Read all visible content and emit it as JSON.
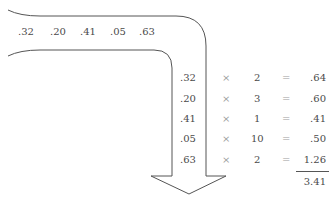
{
  "sequence": [
    ".32",
    ".20",
    ".41",
    ".05",
    ".63"
  ],
  "rows": [
    {
      "value": ".32",
      "times": "×",
      "weight": "2",
      "equals": "=",
      "product": ".64"
    },
    {
      "value": ".20",
      "times": "×",
      "weight": "3",
      "equals": "=",
      "product": ".60"
    },
    {
      "value": ".41",
      "times": "×",
      "weight": "1",
      "equals": "=",
      "product": ".41"
    },
    {
      "value": ".05",
      "times": "×",
      "weight": "10",
      "equals": "=",
      "product": ".50"
    },
    {
      "value": ".63",
      "times": "×",
      "weight": "2",
      "equals": "=",
      "product": "1.26"
    }
  ],
  "total": "3.41",
  "colors": {
    "line": "#555555",
    "text": "#4a4a4a",
    "operator": "#9a9a9a"
  }
}
